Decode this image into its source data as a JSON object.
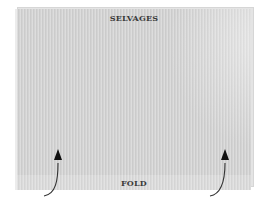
{
  "diagram": {
    "top_label": "SELVAGES",
    "bottom_label": "FOLD",
    "arrows": [
      {
        "name": "left-fold-arrow",
        "direction": "up"
      },
      {
        "name": "right-fold-arrow",
        "direction": "up"
      }
    ],
    "colors": {
      "fabric": "#d3d3d3",
      "text": "#3a3a3a",
      "arrow": "#333333"
    }
  }
}
